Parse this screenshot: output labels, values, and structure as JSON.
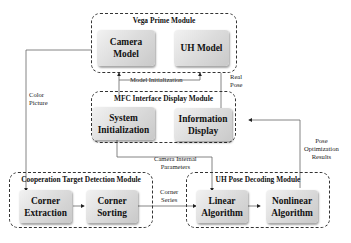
{
  "diagram": {
    "modules": {
      "vega": {
        "title": "Vega Prime Module"
      },
      "mfc": {
        "title": "MFC Interface Display Module"
      },
      "detection": {
        "title": "Cooperation Target Detection Module"
      },
      "decoding": {
        "title": "UH Pose Decoding Module"
      }
    },
    "boxes": {
      "camera_model": {
        "line1": "Camera",
        "line2": "Model"
      },
      "uh_model": {
        "line1": "UH Model"
      },
      "system_init": {
        "line1": "System",
        "line2": "Initialization"
      },
      "info_display": {
        "line1": "Information",
        "line2": "Display"
      },
      "corner_extraction": {
        "line1": "Corner",
        "line2": "Extraction"
      },
      "corner_sorting": {
        "line1": "Corner",
        "line2": "Sorting"
      },
      "linear_algorithm": {
        "line1": "Linear",
        "line2": "Algorithm"
      },
      "nonlinear_algorithm": {
        "line1": "Nonlinear",
        "line2": "Algorithm"
      }
    },
    "edge_labels": {
      "model_initialization": "Model Initialization",
      "real_pose_1": "Real",
      "real_pose_2": "Pose",
      "color_picture_1": "Color",
      "color_picture_2": "Picture",
      "camera_params_1": "Camera Internal",
      "camera_params_2": "Parameters",
      "corner_series_1": "Corner",
      "corner_series_2": "Series",
      "pose_opt_1": "Pose",
      "pose_opt_2": "Optimization",
      "pose_opt_3": "Results"
    },
    "colors": {
      "box_light": "#f2f2f2",
      "box_dark": "#c9c9c9",
      "border": "#333333",
      "line": "#555555"
    }
  }
}
